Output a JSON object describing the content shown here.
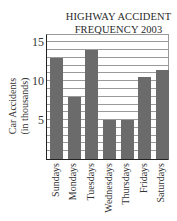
{
  "chart_data": {
    "type": "bar",
    "title": "HIGHWAY ACCIDENT FREQUENCY 2003",
    "title_lines": [
      "HIGHWAY ACCIDENT",
      "FREQUENCY 2003"
    ],
    "xlabel": "",
    "ylabel": "Car Accidents (in thousands)",
    "ylabel_lines": [
      "Car Accidents",
      "(in thousands)"
    ],
    "categories": [
      "Sundays",
      "Mondays",
      "Tuesdays",
      "Wednesdays",
      "Thursdays",
      "Fridays",
      "Saturdays"
    ],
    "values": [
      13,
      8,
      14,
      5,
      5,
      10.6,
      11.4
    ],
    "ylim": [
      0,
      16
    ],
    "yticks": [
      5,
      10,
      15
    ],
    "grid": true,
    "grid_step": 1,
    "bar_color": "#6b6b6b",
    "legend": null
  }
}
